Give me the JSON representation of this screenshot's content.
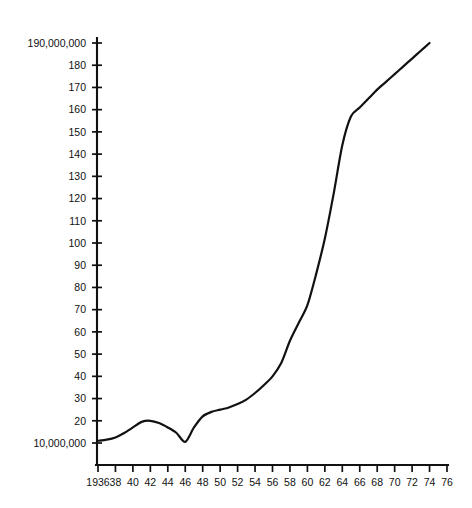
{
  "chart_data": {
    "type": "line",
    "title": "",
    "subtitle": "",
    "xlabel": "",
    "ylabel": "",
    "grid": false,
    "legend": null,
    "xlim": [
      1936,
      1976
    ],
    "ylim": [
      10000000,
      190000000
    ],
    "y_unit": "people",
    "y_tick_labels": [
      "190,000,000",
      "180",
      "170",
      "160",
      "150",
      "140",
      "130",
      "120",
      "110",
      "100",
      "90",
      "80",
      "70",
      "60",
      "50",
      "40",
      "30",
      "20",
      "10,000,000"
    ],
    "y_tick_values": [
      190000000,
      180000000,
      170000000,
      160000000,
      150000000,
      140000000,
      130000000,
      120000000,
      110000000,
      100000000,
      90000000,
      80000000,
      70000000,
      60000000,
      50000000,
      40000000,
      30000000,
      20000000,
      10000000
    ],
    "x_tick_labels": [
      "1936",
      "38",
      "40",
      "42",
      "44",
      "46",
      "48",
      "50",
      "52",
      "54",
      "56",
      "58",
      "60",
      "62",
      "64",
      "66",
      "68",
      "70",
      "72",
      "74",
      "76"
    ],
    "x_tick_values": [
      1936,
      1938,
      1940,
      1942,
      1944,
      1946,
      1948,
      1950,
      1952,
      1954,
      1956,
      1958,
      1960,
      1962,
      1964,
      1966,
      1968,
      1970,
      1972,
      1974,
      1976
    ],
    "series": [
      {
        "name": "value",
        "x": [
          1936,
          1937,
          1938,
          1939,
          1940,
          1941,
          1942,
          1943,
          1944,
          1945,
          1946,
          1947,
          1948,
          1949,
          1950,
          1951,
          1952,
          1953,
          1954,
          1955,
          1956,
          1957,
          1958,
          1959,
          1960,
          1961,
          1962,
          1963,
          1964,
          1965,
          1966,
          1967,
          1968,
          1969,
          1970,
          1971,
          1972,
          1973,
          1974
        ],
        "values": [
          11000000,
          11500000,
          12500000,
          14500000,
          17000000,
          19500000,
          20000000,
          19000000,
          17000000,
          14500000,
          10500000,
          17000000,
          22000000,
          24000000,
          25000000,
          26000000,
          27500000,
          29500000,
          32500000,
          36000000,
          40000000,
          46000000,
          56000000,
          64000000,
          72000000,
          86000000,
          102000000,
          122000000,
          144000000,
          157000000,
          161000000,
          165000000,
          169000000,
          172500000,
          176000000,
          179500000,
          183000000,
          186500000,
          190000000
        ]
      }
    ],
    "annotations": [
      {
        "label": "wartime peak",
        "x": 1941,
        "y": 20000000
      },
      {
        "label": "postwar trough",
        "x": 1946,
        "y": 10500000
      },
      {
        "label": "growth slope break",
        "x": 1964,
        "y": 157000000
      }
    ]
  },
  "axes": {
    "y_axis_name": "vertical-value-axis",
    "x_axis_name": "horizontal-year-axis"
  }
}
